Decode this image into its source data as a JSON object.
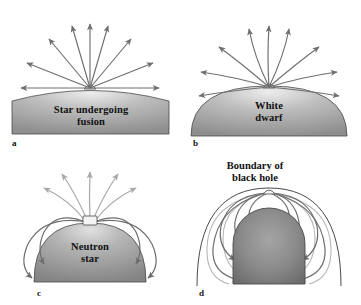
{
  "figure": {
    "background": "#ffffff",
    "width": 361,
    "height": 305
  },
  "style": {
    "ray_color": "#6e6e6e",
    "ray_color_light": "#a8a8a8",
    "outline_color": "#3a3a3a",
    "body_fill_light": "#d8d8d8",
    "body_fill_mid": "#a6a6a6",
    "body_fill_dark": "#6f6f6f",
    "sphere_fill_light": "#9a9a9a",
    "sphere_fill_dark": "#6b6b6b",
    "text_color": "#111111"
  },
  "panels": [
    {
      "id": "a",
      "letter": "a",
      "label": "Star undergoing\nfusion",
      "object": "star-undergoing-fusion",
      "ray_behavior": "straight",
      "description": "Light rays leave the surface in straight lines in all directions; none are recaptured.",
      "escaping_rays": 9,
      "captured_rays": 0
    },
    {
      "id": "b",
      "letter": "b",
      "label": "White\ndwarf",
      "object": "white-dwarf",
      "ray_behavior": "slightly-bent",
      "description": "Stronger gravity bends the light rays slightly, but all still escape.",
      "escaping_rays": 9,
      "captured_rays": 0
    },
    {
      "id": "c",
      "letter": "c",
      "label": "Neutron\nstar",
      "object": "neutron-star",
      "ray_behavior": "strongly-bent",
      "description": "Gravity is strong enough that rays emitted near the horizontal curve back and strike the surface; only rays near the vertical escape.",
      "escaping_rays": 5,
      "captured_rays": 4
    },
    {
      "id": "d",
      "letter": "d",
      "label": "Boundary of\nblack hole",
      "object": "black-hole",
      "ray_behavior": "all-recaptured",
      "description": "All light rays curve back inside the boundary of the black hole; no light escapes.",
      "escaping_rays": 0,
      "captured_rays": 10
    }
  ]
}
